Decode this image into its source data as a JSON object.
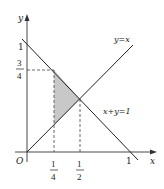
{
  "figure": {
    "axes": {
      "x_label": "x",
      "y_label": "y",
      "origin_label": "O"
    },
    "ticks": {
      "x_one": "1",
      "y_one": "1",
      "y_three_quarters": {
        "num": "3",
        "den": "4"
      },
      "x_one_quarter": {
        "num": "1",
        "den": "4"
      },
      "x_one_half": {
        "num": "1",
        "den": "2"
      }
    },
    "lines": {
      "line_a": "y=x",
      "line_b": "x+y=1"
    },
    "shaded_region": {
      "vertices": [
        [
          0.25,
          0.75
        ],
        [
          0.25,
          0.25
        ],
        [
          0.5,
          0.5
        ]
      ],
      "color": "#c8c8c8"
    },
    "colors": {
      "line": "#222222",
      "axis": "#333333",
      "dashed": "#444444"
    }
  }
}
